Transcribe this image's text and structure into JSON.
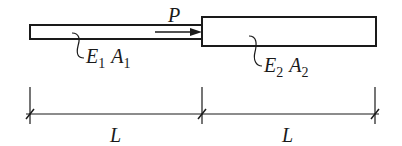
{
  "diagram": {
    "type": "stepped axial bar",
    "load": {
      "label": "P",
      "direction": "right"
    },
    "segments": [
      {
        "name": "left",
        "modulus": "E",
        "modulus_sub": "1",
        "area": "A",
        "area_sub": "1",
        "length": "L"
      },
      {
        "name": "right",
        "modulus": "E",
        "modulus_sub": "2",
        "area": "A",
        "area_sub": "2",
        "length": "L"
      }
    ]
  },
  "colors": {
    "stroke": "#1a1a1a",
    "background": "#ffffff"
  }
}
